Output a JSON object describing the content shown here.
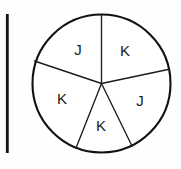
{
  "figure": {
    "name": "spinner-circle-diagram",
    "background_color": "#fefefe",
    "stroke_color": "#111111",
    "label_color": "#1a1a1a",
    "circle": {
      "center_x": 101.5,
      "center_y": 83.5,
      "radius": 69
    },
    "margin_rule": {
      "x": 7,
      "y_top": 14,
      "y_bottom": 153
    },
    "sectors": [
      {
        "id": "sector-top-left",
        "label": "J",
        "label_x": 78,
        "label_y": 49
      },
      {
        "id": "sector-top-right",
        "label": "K",
        "label_x": 125,
        "label_y": 50
      },
      {
        "id": "sector-left",
        "label": "K",
        "label_x": 62,
        "label_y": 98
      },
      {
        "id": "sector-right",
        "label": "J",
        "label_x": 140,
        "label_y": 100
      },
      {
        "id": "sector-bottom",
        "label": "K",
        "label_x": 101,
        "label_y": 125
      }
    ],
    "radii": [
      {
        "id": "radius-up",
        "x2": 101.5,
        "y2": 14.5
      },
      {
        "id": "radius-upper-left",
        "x2": 34.5,
        "y2": 61.0
      },
      {
        "id": "radius-upper-right",
        "x2": 168.0,
        "y2": 69.5
      },
      {
        "id": "radius-lower-left",
        "x2": 76.0,
        "y2": 148.0
      },
      {
        "id": "radius-lower-right",
        "x2": 132.0,
        "y2": 146.0
      }
    ]
  }
}
